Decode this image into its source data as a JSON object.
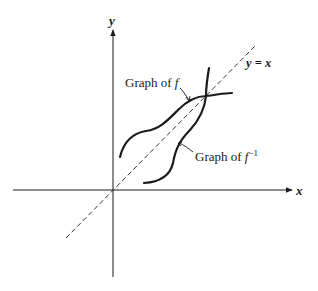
{
  "diagram": {
    "type": "function-inverse-graph",
    "axes": {
      "x_label": "x",
      "y_label": "y"
    },
    "line": {
      "label": "y = x",
      "style": "dashed"
    },
    "curves": [
      {
        "name": "f",
        "label_prefix": "Graph of ",
        "label_symbol": "f",
        "superscript": ""
      },
      {
        "name": "f-inverse",
        "label_prefix": "Graph of ",
        "label_symbol": "f",
        "superscript": "−1"
      }
    ],
    "colors": {
      "ink": "#1a1a1a",
      "background": "#ffffff"
    }
  }
}
